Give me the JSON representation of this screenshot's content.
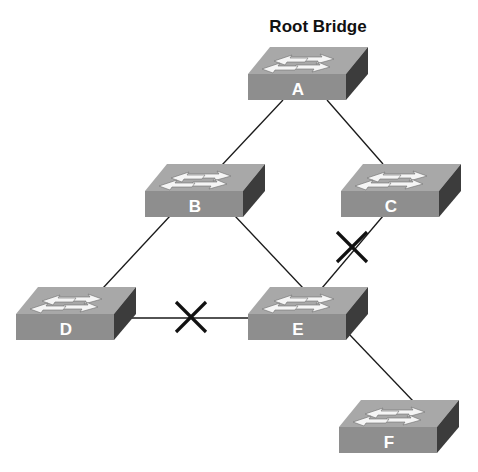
{
  "title": "Root Bridge",
  "colors": {
    "top_face": "#a9a9a9",
    "front_face": "#8c8c8c",
    "side_face": "#3a3a3a",
    "arrow": "#f4f4f4",
    "link": "#1a1a1a",
    "blocked_mark": "#111111"
  },
  "switches": [
    {
      "id": "A",
      "label": "A",
      "role": "root-bridge",
      "x": 248,
      "y": 46
    },
    {
      "id": "B",
      "label": "B",
      "x": 145,
      "y": 164
    },
    {
      "id": "C",
      "label": "C",
      "x": 341,
      "y": 164
    },
    {
      "id": "D",
      "label": "D",
      "x": 16,
      "y": 287
    },
    {
      "id": "E",
      "label": "E",
      "x": 248,
      "y": 287
    },
    {
      "id": "F",
      "label": "F",
      "x": 339,
      "y": 400
    }
  ],
  "links": [
    {
      "from": "A",
      "to": "B",
      "blocked": false
    },
    {
      "from": "A",
      "to": "C",
      "blocked": false
    },
    {
      "from": "B",
      "to": "D",
      "blocked": false
    },
    {
      "from": "B",
      "to": "E",
      "blocked": false
    },
    {
      "from": "C",
      "to": "E",
      "blocked": true
    },
    {
      "from": "D",
      "to": "E",
      "blocked": true
    },
    {
      "from": "E",
      "to": "F",
      "blocked": false
    }
  ]
}
